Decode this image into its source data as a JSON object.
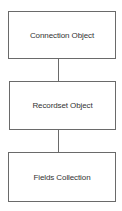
{
  "diagram": {
    "type": "hierarchy",
    "colors": {
      "border": "#6a6a6a",
      "text": "#333333",
      "background": "#ffffff"
    },
    "nodes": [
      {
        "id": "connection",
        "label": "Connection Object"
      },
      {
        "id": "recordset",
        "label": "Recordset Object"
      },
      {
        "id": "fields",
        "label": "Fields Collection"
      }
    ],
    "edges": [
      {
        "from": "connection",
        "to": "recordset"
      },
      {
        "from": "recordset",
        "to": "fields"
      }
    ]
  }
}
